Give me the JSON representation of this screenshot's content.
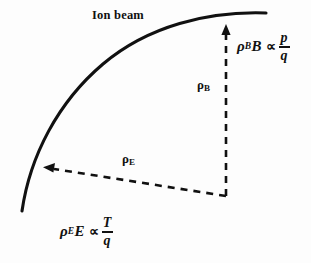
{
  "figure": {
    "background_color": "#fdfdfd",
    "ink_color": "#111111",
    "width": 311,
    "height": 263
  },
  "labels": {
    "ion_beam": "Ion beam",
    "rho_b": {
      "symbol": "ρ",
      "subscript": "B"
    },
    "rho_e": {
      "symbol": "ρ",
      "subscript": "E"
    }
  },
  "formulas": {
    "magnetic": {
      "rho": "ρ",
      "rho_subscript": "B",
      "field": "B",
      "proportional": "∝",
      "numerator": "p",
      "denominator": "q",
      "plain_text": "ρ_B B ∝ p/q"
    },
    "electric": {
      "rho": "ρ",
      "rho_subscript": "E",
      "field": "E",
      "proportional": "∝",
      "numerator": "T",
      "denominator": "q",
      "plain_text": "ρ_E E ∝ T/q"
    }
  },
  "graphics": {
    "beam_curve": {
      "kind": "solid-arc",
      "stroke_width": 3.1,
      "start": [
        22,
        211
      ],
      "end": [
        266,
        13
      ]
    },
    "rho_b_arrow": {
      "kind": "dashed-arrow",
      "direction": "up",
      "from": [
        226,
        196
      ],
      "to": [
        226,
        27
      ],
      "dash": "7,6"
    },
    "rho_e_arrow": {
      "kind": "dashed-arrow",
      "direction": "up-left",
      "from": [
        226,
        196
      ],
      "to": [
        46,
        168
      ],
      "dash": "7,6"
    }
  }
}
